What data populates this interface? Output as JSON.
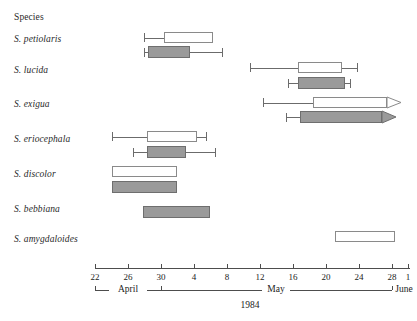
{
  "header": {
    "species_column_title": "Species"
  },
  "axis": {
    "year": "1984",
    "tick_labels": [
      "22",
      "26",
      "30",
      "4",
      "8",
      "12",
      "16",
      "20",
      "24",
      "28",
      "1"
    ],
    "tick_x": [
      95,
      128,
      161,
      194,
      227,
      260,
      293,
      326,
      359,
      392,
      408
    ],
    "months": [
      {
        "label": "April",
        "center_x": 128,
        "start_x": 95,
        "end_x": 161
      },
      {
        "label": "May",
        "center_x": 276,
        "start_x": 161,
        "end_x": 392
      },
      {
        "label": "June",
        "center_x": 404,
        "start_x": 392,
        "end_x": 410
      }
    ],
    "line_left_x": 95,
    "line_right_x": 410,
    "line_y": 268
  },
  "chart_data": {
    "type": "bar",
    "title": "",
    "subtitle": "",
    "xlabel": "1984",
    "ylabel": "Species",
    "grid": false,
    "legend": [],
    "x_axis": {
      "ticks": [
        "22",
        "26",
        "30",
        "4",
        "8",
        "12",
        "16",
        "20",
        "24",
        "28",
        "1"
      ],
      "months": [
        "April",
        "May",
        "June"
      ],
      "year": "1984",
      "units": "day of month"
    },
    "note": "Horizontal box-and-whisker style flowering/emergence intervals per species; white bars = first series, gray bars = second series. Values given as axis day positions (April 22 = 22, May days continue, June 1 at far right).",
    "categories": [
      "S. petiolaris",
      "S. lucida",
      "S. exigua",
      "S. eriocephala",
      "S. discolor",
      "S. bebbiana",
      "S. amygdaloides"
    ],
    "series": [
      {
        "name": "white",
        "bars": [
          {
            "category": "S. petiolaris",
            "whisker_low": "April 23",
            "box_start": "April 25",
            "box_end": "May 1",
            "whisker_high": "May 1",
            "arrow": false,
            "px": {
              "whisker_low": 144,
              "box_start": 164,
              "box_end": 213,
              "whisker_high": 213
            }
          },
          {
            "category": "S. lucida",
            "whisker_low": "May 11",
            "box_start": "May 17",
            "box_end": "May 22",
            "whisker_high": "May 24",
            "arrow": false,
            "px": {
              "whisker_low": 250,
              "box_start": 298,
              "box_end": 342,
              "whisker_high": 357
            }
          },
          {
            "category": "S. exigua",
            "whisker_low": "May 13",
            "box_start": "May 19",
            "box_end": "June 2",
            "whisker_high": "June 2",
            "arrow": true,
            "px": {
              "whisker_low": 263,
              "box_start": 313,
              "box_end": 387,
              "whisker_high": 400
            }
          },
          {
            "category": "S. eriocephala",
            "whisker_low": "April 24",
            "box_start": "April 28",
            "box_end": "May 6",
            "whisker_high": "May 7",
            "arrow": false,
            "px": {
              "whisker_low": 112,
              "box_start": 147,
              "box_end": 197,
              "whisker_high": 206
            }
          },
          {
            "category": "S. discolor",
            "whisker_low": null,
            "box_start": "April 24",
            "box_end": "May 2",
            "whisker_high": null,
            "arrow": false,
            "px": {
              "whisker_low": null,
              "box_start": 112,
              "box_end": 177,
              "whisker_high": null
            }
          },
          {
            "category": "S. bebbiana",
            "whisker_low": null,
            "box_start": null,
            "box_end": null,
            "whisker_high": null,
            "arrow": false,
            "px": {
              "whisker_low": null,
              "box_start": null,
              "box_end": null,
              "whisker_high": null
            }
          },
          {
            "category": "S. amygdaloides",
            "whisker_low": null,
            "box_start": "May 24",
            "box_end": "May 31",
            "whisker_high": null,
            "arrow": false,
            "px": {
              "whisker_low": null,
              "box_start": 335,
              "box_end": 395,
              "whisker_high": null
            }
          }
        ]
      },
      {
        "name": "gray",
        "bars": [
          {
            "category": "S. petiolaris",
            "whisker_low": "April 23",
            "box_start": "April 23",
            "box_end": "April 28",
            "whisker_high": "May 3",
            "arrow": false,
            "px": {
              "whisker_low": 144,
              "box_start": 148,
              "box_end": 190,
              "whisker_high": 222
            }
          },
          {
            "category": "S. lucida",
            "whisker_low": "May 16",
            "box_start": "May 17",
            "box_end": "May 22",
            "whisker_high": "May 23",
            "arrow": false,
            "px": {
              "whisker_low": 288,
              "box_start": 298,
              "box_end": 345,
              "whisker_high": 350
            }
          },
          {
            "category": "S. exigua",
            "whisker_low": "May 16",
            "box_start": "May 18",
            "box_end": "June 1",
            "whisker_high": "June 1",
            "arrow": true,
            "px": {
              "whisker_low": 286,
              "box_start": 300,
              "box_end": 382,
              "whisker_high": 395
            }
          },
          {
            "category": "S. eriocephala",
            "whisker_low": "April 27",
            "box_start": "April 28",
            "box_end": "May 5",
            "whisker_high": "May 8",
            "arrow": false,
            "px": {
              "whisker_low": 133,
              "box_start": 147,
              "box_end": 186,
              "whisker_high": 215
            }
          },
          {
            "category": "S. discolor",
            "whisker_low": null,
            "box_start": "April 24",
            "box_end": "May 2",
            "whisker_high": null,
            "arrow": false,
            "px": {
              "whisker_low": null,
              "box_start": 112,
              "box_end": 177,
              "whisker_high": null
            }
          },
          {
            "category": "S. bebbiana",
            "whisker_low": null,
            "box_start": "April 28",
            "box_end": "May 6",
            "whisker_high": null,
            "arrow": false,
            "px": {
              "whisker_low": null,
              "box_start": 143,
              "box_end": 210,
              "whisker_high": null
            }
          },
          {
            "category": "S. amygdaloides",
            "whisker_low": null,
            "box_start": null,
            "box_end": null,
            "whisker_high": null,
            "arrow": false,
            "px": {
              "whisker_low": null,
              "box_start": null,
              "box_end": null,
              "whisker_high": null
            }
          }
        ]
      }
    ],
    "row_y": {
      "S. petiolaris": {
        "label_y": 40,
        "white_y": 32,
        "gray_y": 46
      },
      "S. lucida": {
        "label_y": 71,
        "white_y": 62,
        "gray_y": 77
      },
      "S. exigua": {
        "label_y": 105,
        "white_y": 97,
        "gray_y": 111
      },
      "S. eriocephala": {
        "label_y": 140,
        "white_y": 131,
        "gray_y": 146
      },
      "S. discolor": {
        "label_y": 175,
        "white_y": 166,
        "gray_y": 181
      },
      "S. bebbiana": {
        "label_y": 210,
        "white_y": null,
        "gray_y": 206
      },
      "S. amygdaloides": {
        "label_y": 240,
        "white_y": 231,
        "gray_y": null
      }
    }
  },
  "colors": {
    "gray_fill": "#9a9a9a",
    "gray_border": "#6e6e6e",
    "white_fill": "#ffffff",
    "box_border": "#8a8a8a",
    "axis": "#4d4d4d",
    "text": "#222222"
  }
}
